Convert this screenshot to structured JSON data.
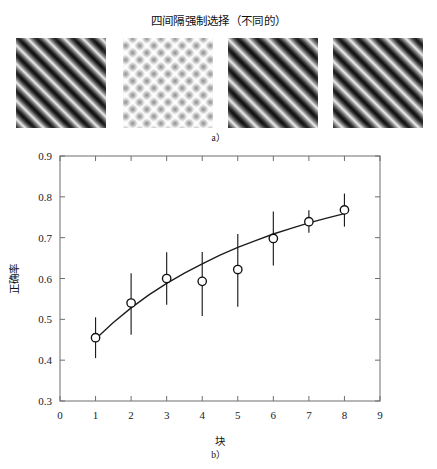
{
  "figure": {
    "title": "四间隔强制选择（不同的）",
    "panel_a_caption": "a）",
    "panel_b_caption": "b）"
  },
  "panel_a": {
    "name": "texture-stimuli-row",
    "patches": [
      {
        "id": "patch-1",
        "label": "patch-1"
      },
      {
        "id": "patch-2",
        "label": "patch-2"
      },
      {
        "id": "patch-3",
        "label": "patch-3"
      },
      {
        "id": "patch-4",
        "label": "patch-4"
      }
    ]
  },
  "chart_data": {
    "type": "scatter",
    "title": "四间隔强制选择（不同的）",
    "xlabel": "块",
    "ylabel": "正确率",
    "xlim": [
      0,
      9
    ],
    "ylim": [
      0.3,
      0.9
    ],
    "xticks": [
      "0",
      "1",
      "2",
      "3",
      "4",
      "5",
      "6",
      "7",
      "8",
      "9"
    ],
    "yticks": [
      "0.3",
      "0.4",
      "0.5",
      "0.6",
      "0.7",
      "0.8",
      "0.9"
    ],
    "grid": false,
    "legend": "none",
    "marker": "open-circle",
    "x": [
      1,
      2,
      3,
      4,
      5,
      6,
      7,
      8
    ],
    "values": [
      0.455,
      0.54,
      0.6,
      0.593,
      0.622,
      0.698,
      0.739,
      0.768
    ],
    "err_low": [
      0.405,
      0.462,
      0.536,
      0.508,
      0.531,
      0.632,
      0.712,
      0.727
    ],
    "err_high": [
      0.505,
      0.613,
      0.664,
      0.665,
      0.709,
      0.764,
      0.767,
      0.808
    ],
    "fit_curve": {
      "name": "fitted-curve",
      "x": [
        1,
        1.5,
        2,
        2.5,
        3,
        3.5,
        4,
        4.5,
        5,
        5.5,
        6,
        6.5,
        7,
        7.5,
        8
      ],
      "y": [
        0.452,
        0.492,
        0.528,
        0.56,
        0.588,
        0.613,
        0.636,
        0.657,
        0.676,
        0.693,
        0.709,
        0.723,
        0.736,
        0.748,
        0.759
      ]
    },
    "colors": {
      "axis": "#6e6e6e",
      "data": "#1c1c1c",
      "marker_fill": "#ffffff",
      "background": "#ffffff"
    }
  }
}
